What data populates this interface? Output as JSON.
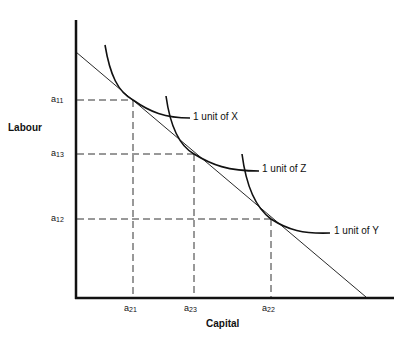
{
  "diagram": {
    "type": "isoquant-isocost",
    "y_axis_label": "Labour",
    "x_axis_label": "Capital",
    "y_ticks": [
      {
        "base": "a",
        "sub": "11"
      },
      {
        "base": "a",
        "sub": "13"
      },
      {
        "base": "a",
        "sub": "12"
      }
    ],
    "x_ticks": [
      {
        "base": "a",
        "sub": "21"
      },
      {
        "base": "a",
        "sub": "23"
      },
      {
        "base": "a",
        "sub": "22"
      }
    ],
    "curves": [
      {
        "label": "1 unit of X"
      },
      {
        "label": "1 unit of Z"
      },
      {
        "label": "1 unit of Y"
      }
    ],
    "colors": {
      "line": "#111111",
      "dash": "#333333",
      "background": "#ffffff"
    }
  }
}
